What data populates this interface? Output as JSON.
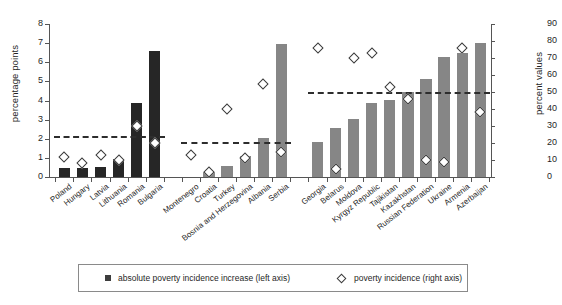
{
  "chart_data": {
    "type": "bar",
    "title": "",
    "xlabel": "",
    "ylabel": "percentage points",
    "y2label": "percent values",
    "ylim": [
      0,
      8
    ],
    "y2lim": [
      0,
      90
    ],
    "grid": false,
    "legend_position": "bottom",
    "left_ticks": [
      "0",
      "1",
      "2",
      "3",
      "4",
      "5",
      "6",
      "7",
      "8"
    ],
    "right_ticks": [
      "0",
      "10",
      "20",
      "30",
      "40",
      "50",
      "60",
      "70",
      "80",
      "90"
    ],
    "categories": [
      "Poland",
      "Hungary",
      "Latvia",
      "Lithuania",
      "Romania",
      "Bulgaria",
      "Montenegro",
      "Croatia",
      "Turkey",
      "Bosnia and Herzegovina",
      "Albania",
      "Serbia",
      "Georgia",
      "Belarus",
      "Moldova",
      "Kyrgyz Republic",
      "Tajikistan",
      "Kazakhstan",
      "Russian Federation",
      "Ukraine",
      "Armenia",
      "Azerbaijan"
    ],
    "series": [
      {
        "name": "absolute poverty incidence increase (left axis)",
        "axis": "left",
        "type": "bar",
        "color": "#262626",
        "values": [
          0.45,
          0.45,
          0.5,
          0.95,
          3.85,
          6.6,
          null,
          0.25,
          0.55,
          1.1,
          2.05,
          6.95,
          1.85,
          2.55,
          3.05,
          3.85,
          4.05,
          4.45,
          5.15,
          6.25,
          6.5,
          7.0
        ]
      },
      {
        "name": "poverty incidence (right axis)",
        "axis": "right",
        "type": "scatter",
        "marker": "diamond",
        "values": [
          12,
          8,
          13,
          10,
          30,
          20,
          13,
          3,
          40,
          11,
          55,
          15,
          76,
          5,
          70,
          73,
          53,
          46,
          10,
          9,
          76,
          38
        ]
      }
    ],
    "reference_lines": [
      {
        "name": "group-1-average",
        "axis": "left",
        "value": 2.12,
        "span": [
          0,
          5
        ]
      },
      {
        "name": "group-2-average",
        "axis": "left",
        "value": 1.85,
        "span": [
          6,
          11
        ]
      },
      {
        "name": "group-3-average",
        "axis": "left",
        "value": 4.45,
        "span": [
          12,
          21
        ]
      }
    ],
    "group_breaks": [
      6,
      12
    ]
  },
  "legend": {
    "bars_label": "absolute poverty incidence increase (left axis)",
    "diamonds_label": "poverty incidence (right axis)"
  }
}
